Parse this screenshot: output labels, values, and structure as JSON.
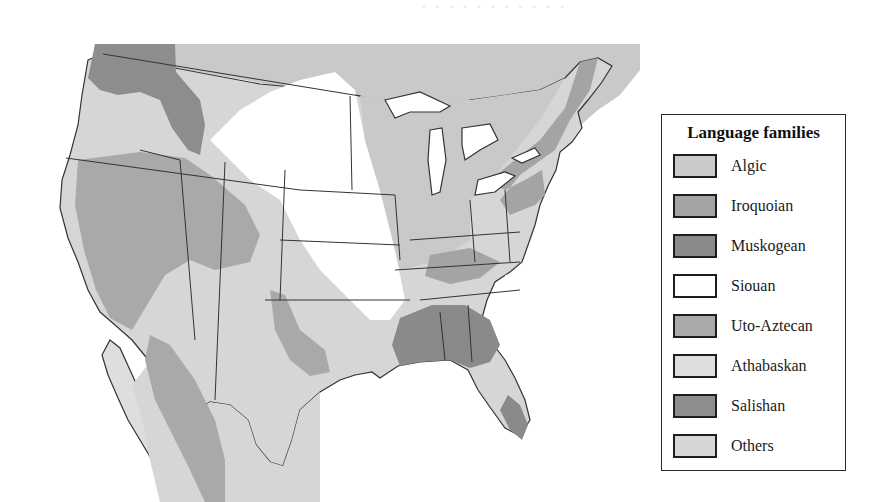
{
  "figure": {
    "type": "map"
  },
  "legend": {
    "title": "Language families",
    "items": [
      {
        "label": "Algic",
        "color": "#c9c9c9"
      },
      {
        "label": "Iroquoian",
        "color": "#a4a4a4"
      },
      {
        "label": "Muskogean",
        "color": "#8a8a8a"
      },
      {
        "label": "Siouan",
        "color": "#ffffff"
      },
      {
        "label": "Uto-Aztecan",
        "color": "#a9a9a9"
      },
      {
        "label": "Athabaskan",
        "color": "#dedede"
      },
      {
        "label": "Salishan",
        "color": "#8d8d8d"
      },
      {
        "label": "Others",
        "color": "#d6d6d6"
      }
    ]
  },
  "colors": {
    "border_line": "#333333",
    "water": "#ffffff",
    "legend_border": "#2a2a2a"
  }
}
